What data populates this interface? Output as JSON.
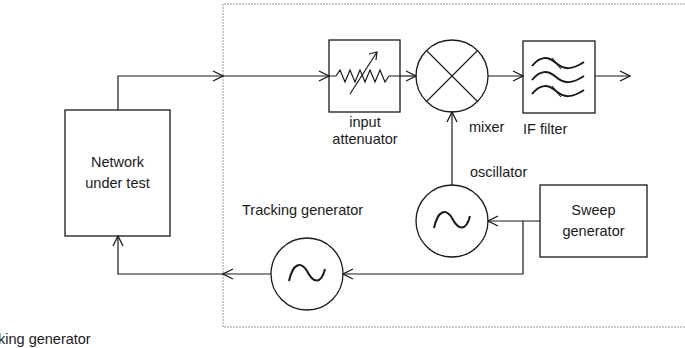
{
  "diagram": {
    "type": "block-diagram",
    "colors": {
      "stroke": "#1a1a1a",
      "boundary": "#9a9a9a",
      "background": "#ffffff"
    },
    "blocks": {
      "network": {
        "label_line1": "Network",
        "label_line2": "under test"
      },
      "attenuator": {
        "label_line1": "input",
        "label_line2": "attenuator",
        "icon": "variable-resistor-icon"
      },
      "mixer": {
        "label": "mixer",
        "icon": "mixer-x-icon"
      },
      "if_filter": {
        "label": "IF filter",
        "icon": "filter-waves-icon"
      },
      "oscillator": {
        "label": "oscillator",
        "icon": "sine-wave-icon"
      },
      "sweep": {
        "label_line1": "Sweep",
        "label_line2": "generator"
      },
      "tracking": {
        "label": "Tracking generator",
        "icon": "sine-wave-icon"
      }
    },
    "caption_partial": "king generator",
    "connections": [
      {
        "from": "Network under test",
        "to": "input attenuator"
      },
      {
        "from": "input attenuator",
        "to": "mixer"
      },
      {
        "from": "mixer",
        "to": "IF filter"
      },
      {
        "from": "IF filter",
        "to": "output"
      },
      {
        "from": "oscillator",
        "to": "mixer"
      },
      {
        "from": "Sweep generator",
        "to": "oscillator"
      },
      {
        "from": "Sweep generator",
        "to": "Tracking generator"
      },
      {
        "from": "Tracking generator",
        "to": "Network under test"
      }
    ]
  }
}
